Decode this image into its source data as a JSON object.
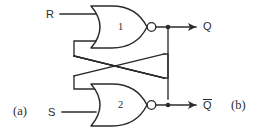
{
  "figure": {
    "type": "logic-circuit-schematic",
    "background_color": "#ffffff",
    "line_color": "#2b2b2b"
  },
  "labels": {
    "input_r": "R",
    "input_s": "S",
    "output_q": "Q",
    "output_qbar": "Q",
    "output_qbar_has_overbar": true,
    "gate1_number": "1",
    "gate2_number": "2",
    "figure_a": "(a)",
    "figure_b": "(b)"
  },
  "gates": [
    {
      "id": "gate-1",
      "number": "1",
      "type": "NOR",
      "inputs": [
        "R",
        "feedback-from-qbar"
      ],
      "output": "Q"
    },
    {
      "id": "gate-2",
      "number": "2",
      "type": "NOR",
      "inputs": [
        "S",
        "feedback-from-q"
      ],
      "output": "Q"
    }
  ],
  "icons": {
    "nor_gate": "nor-gate-icon",
    "inversion_bubble": "inversion-bubble-icon",
    "junction_dot": "junction-dot-icon",
    "arrowhead": "arrowhead-icon"
  }
}
